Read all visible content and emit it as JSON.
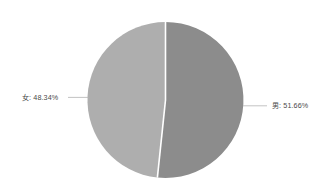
{
  "chart_data": {
    "type": "pie",
    "title": "",
    "subtitle": "",
    "xlabel": "",
    "ylabel": "",
    "legend_position": "none",
    "grid": false,
    "categories": [
      "男",
      "女"
    ],
    "values": [
      51.66,
      48.34
    ],
    "unit": "%",
    "slices": [
      {
        "name": "男",
        "value": 51.66,
        "label": "男: 51.66%",
        "percent_text": "51.66%",
        "color": "#8c8c8c",
        "side": "right"
      },
      {
        "name": "女",
        "value": 48.34,
        "label": "女: 48.34%",
        "percent_text": "48.34%",
        "color": "#aeaeae",
        "side": "left"
      }
    ],
    "colors": {
      "background": "#ffffff",
      "male_slice": "#8c8c8c",
      "female_slice": "#aeaeae",
      "leader_line": "#b4b4b4",
      "label_text": "#4a4a4a",
      "slice_divider": "#ffffff"
    }
  },
  "labels": {
    "female": "女: 48.34%",
    "male": "男: 51.66%"
  }
}
